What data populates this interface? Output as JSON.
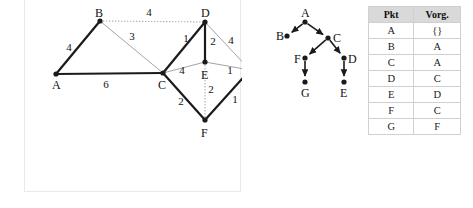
{
  "graph": {
    "nodes": [
      {
        "id": "A",
        "label": "A",
        "x": 31,
        "y": 74,
        "lx": 27,
        "ly": 89
      },
      {
        "id": "B",
        "label": "B",
        "x": 75,
        "y": 21,
        "lx": 70,
        "ly": 17
      },
      {
        "id": "C",
        "label": "C",
        "x": 138,
        "y": 73,
        "lx": 133,
        "ly": 89
      },
      {
        "id": "D",
        "label": "D",
        "x": 180,
        "y": 22,
        "lx": 176,
        "ly": 17
      },
      {
        "id": "E",
        "label": "E",
        "x": 180,
        "y": 62,
        "lx": 176,
        "ly": 79
      },
      {
        "id": "F",
        "label": "F",
        "x": 180,
        "y": 120,
        "lx": 176,
        "ly": 137
      },
      {
        "id": "G",
        "label": "G",
        "x": 225,
        "y": 70,
        "lx": 231,
        "ly": 74
      }
    ],
    "edges": [
      {
        "from": "A",
        "to": "B",
        "weight": "4",
        "style": "solid",
        "lx": 44,
        "ly": 51
      },
      {
        "from": "A",
        "to": "C",
        "weight": "6",
        "style": "solid",
        "lx": 81,
        "ly": 88
      },
      {
        "from": "B",
        "to": "D",
        "weight": "4",
        "style": "dotted",
        "lx": 124,
        "ly": 16
      },
      {
        "from": "B",
        "to": "C",
        "weight": "3",
        "style": "thin",
        "lx": 107,
        "ly": 40
      },
      {
        "from": "C",
        "to": "D",
        "weight": "1",
        "style": "solid",
        "lx": 161,
        "ly": 42
      },
      {
        "from": "C",
        "to": "E",
        "weight": "4",
        "style": "thin",
        "lx": 157,
        "ly": 74
      },
      {
        "from": "C",
        "to": "F",
        "weight": "2",
        "style": "solid",
        "lx": 156,
        "ly": 105
      },
      {
        "from": "D",
        "to": "E",
        "weight": "2",
        "style": "solid",
        "lx": 188,
        "ly": 45
      },
      {
        "from": "D",
        "to": "G",
        "weight": "4",
        "style": "thin",
        "lx": 206,
        "ly": 44
      },
      {
        "from": "E",
        "to": "F",
        "weight": "2",
        "style": "dotted",
        "lx": 186,
        "ly": 93
      },
      {
        "from": "E",
        "to": "G",
        "weight": "1",
        "style": "thin",
        "lx": 205,
        "ly": 74
      },
      {
        "from": "F",
        "to": "G",
        "weight": "1",
        "style": "solid",
        "lx": 210,
        "ly": 103
      }
    ]
  },
  "tree": {
    "nodes": [
      {
        "id": "A",
        "label": "A",
        "x": 47,
        "y": 22,
        "lx": 43,
        "ly": 17
      },
      {
        "id": "B",
        "label": "B",
        "x": 29,
        "y": 36,
        "lx": 18,
        "ly": 40
      },
      {
        "id": "C",
        "label": "C",
        "x": 70,
        "y": 38,
        "lx": 75,
        "ly": 42
      },
      {
        "id": "F",
        "label": "F",
        "x": 47,
        "y": 58,
        "lx": 36,
        "ly": 63
      },
      {
        "id": "D",
        "label": "D",
        "x": 86,
        "y": 58,
        "lx": 90,
        "ly": 63
      },
      {
        "id": "G",
        "label": "G",
        "x": 47,
        "y": 82,
        "lx": 43,
        "ly": 97
      },
      {
        "id": "E",
        "label": "E",
        "x": 86,
        "y": 82,
        "lx": 82,
        "ly": 97
      }
    ],
    "edges": [
      {
        "from": "A",
        "to": "B"
      },
      {
        "from": "A",
        "to": "C"
      },
      {
        "from": "C",
        "to": "F"
      },
      {
        "from": "C",
        "to": "D"
      },
      {
        "from": "F",
        "to": "G"
      },
      {
        "from": "D",
        "to": "E"
      }
    ]
  },
  "table": {
    "headers": [
      "Pkt",
      "Vorg."
    ],
    "rows": [
      [
        "A",
        "{}"
      ],
      [
        "B",
        "A"
      ],
      [
        "C",
        "A"
      ],
      [
        "D",
        "C"
      ],
      [
        "E",
        "D"
      ],
      [
        "F",
        "C"
      ],
      [
        "G",
        "F"
      ]
    ]
  },
  "colors": {
    "stroke_dark": "#1a1a1a",
    "stroke_light": "#9a9a9a",
    "dotted": "#b0b0b0",
    "header_bg": "#d9d9d9",
    "panel_border": "#e9e9e9"
  }
}
